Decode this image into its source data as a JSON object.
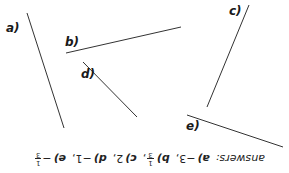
{
  "lines": [
    {
      "id": "a",
      "label": "a)",
      "x1": 27,
      "y1": 13,
      "x2": 64,
      "y2": 128,
      "label_x": 6,
      "label_y": 22
    },
    {
      "id": "b",
      "label": "b)",
      "x1": 66,
      "y1": 53,
      "x2": 181,
      "y2": 27,
      "label_x": 65,
      "label_y": 36
    },
    {
      "id": "c",
      "label": "c)",
      "x1": 249,
      "y1": 5,
      "x2": 207,
      "y2": 107,
      "label_x": 229,
      "label_y": 5
    },
    {
      "id": "d",
      "label": "d)",
      "x1": 83,
      "y1": 62,
      "x2": 137,
      "y2": 117,
      "label_x": 81,
      "label_y": 68
    },
    {
      "id": "e",
      "label": "e)",
      "x1": 187,
      "y1": 115,
      "x2": 283,
      "y2": 147,
      "label_x": 186,
      "label_y": 120
    }
  ],
  "line_color": "#333333",
  "answers": {
    "heading": "answers:",
    "items": [
      {
        "key": "a)",
        "value": "−3",
        "sep": ","
      },
      {
        "key": "b)",
        "frac_num": "1",
        "frac_den": "3",
        "sep": ","
      },
      {
        "key": "c)",
        "value": "2",
        "sep": ","
      },
      {
        "key": "d)",
        "value": "−1",
        "sep": ","
      },
      {
        "key": "e)",
        "value": "−",
        "frac_num": "1",
        "frac_den": "3",
        "sep": ""
      }
    ],
    "orientation": "upside-down"
  }
}
